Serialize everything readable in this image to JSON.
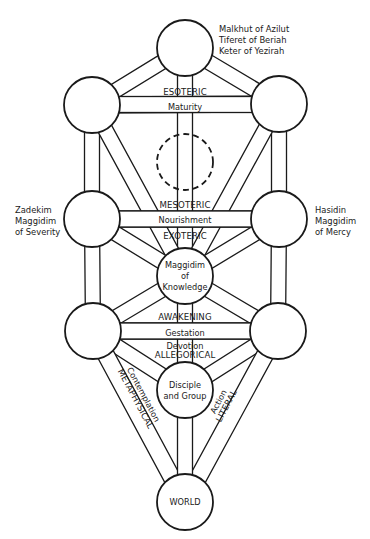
{
  "nodes": [
    {
      "id": "crown",
      "label": [],
      "style": "solid"
    },
    {
      "id": "upper-left",
      "label": [],
      "style": "solid"
    },
    {
      "id": "upper-right",
      "label": [],
      "style": "solid"
    },
    {
      "id": "hidden-center",
      "label": [],
      "style": "dashed"
    },
    {
      "id": "middle-left",
      "label": [],
      "style": "solid"
    },
    {
      "id": "middle-right",
      "label": [],
      "style": "solid"
    },
    {
      "id": "knowledge",
      "label": [
        "Maggidim",
        "of",
        "Knowledge"
      ],
      "style": "solid"
    },
    {
      "id": "lower-left",
      "label": [],
      "style": "solid"
    },
    {
      "id": "lower-right",
      "label": [],
      "style": "solid"
    },
    {
      "id": "disciple",
      "label": [
        "Disciple",
        "and Group"
      ],
      "style": "solid"
    },
    {
      "id": "world",
      "label": [
        "WORLD"
      ],
      "style": "solid"
    }
  ],
  "side_labels": {
    "crown": [
      "Malkhut of Azilut",
      "Tiferet of Beriah",
      "Keter of Yezirah"
    ],
    "left": [
      "Zadekim",
      "Maggidim",
      "of Severity"
    ],
    "right": [
      "Hasidin",
      "Maggidim",
      "of Mercy"
    ]
  },
  "levels": {
    "esoteric": "ESOTERIC",
    "maturity": "Maturity",
    "mesoteric": "MESOTERIC",
    "nourishment": "Nourishment",
    "exoteric": "EXOTERIC",
    "awakening": "AWAKENING",
    "gestation": "Gestation",
    "devotion": "Devotion",
    "allegorical": "ALLEGORICAL",
    "contemplation": "Contemplation",
    "metaphysical": "METAPHYSICAL",
    "action": "Action",
    "literal": "LITERAL"
  }
}
